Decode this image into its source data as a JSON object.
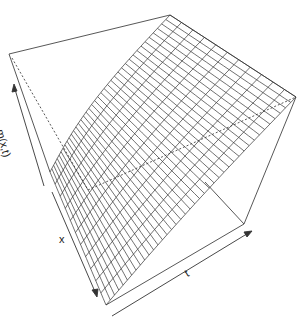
{
  "chart_data": {
    "type": "surface3d",
    "title": "",
    "xlabel": "x",
    "ylabel": "t",
    "zlabel": "m(x,t)",
    "ticks": false,
    "box": true,
    "grid": {
      "fine_lines": 40,
      "coarse_lines": 11
    },
    "projection": {
      "box_top_left": [
        9,
        54
      ],
      "apex": [
        170,
        15
      ],
      "right_corner": [
        296,
        97
      ],
      "front_bottom": [
        106,
        305
      ],
      "front_right": [
        244,
        224
      ],
      "surface_low_corner": [
        50,
        172
      ]
    }
  },
  "labels": {
    "z": "m(x,t)",
    "x": "x",
    "t": "t"
  },
  "colors": {
    "line": "#333333",
    "background": "#ffffff"
  }
}
